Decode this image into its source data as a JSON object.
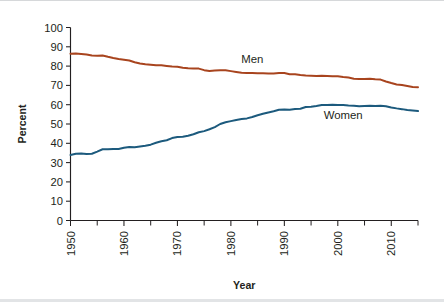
{
  "chart_data": {
    "type": "line",
    "title": "",
    "subtitle": "",
    "xlabel": "Year",
    "ylabel": "Percent",
    "xlim": [
      1950,
      2015
    ],
    "ylim": [
      0,
      100
    ],
    "grid": false,
    "legend_position": "inline-annotation",
    "x_ticks_major": [
      1950,
      1960,
      1970,
      1980,
      1990,
      2000,
      2010
    ],
    "x_ticks_minor": [
      1955,
      1965,
      1975,
      1985,
      1995,
      2005,
      2015
    ],
    "x_tick_labels": [
      "1950",
      "1960",
      "1970",
      "1980",
      "1990",
      "2000",
      "2010"
    ],
    "y_ticks": [
      0,
      10,
      20,
      30,
      40,
      50,
      60,
      70,
      80,
      90,
      100
    ],
    "y_tick_labels": [
      "0",
      "10",
      "20",
      "30",
      "40",
      "50",
      "60",
      "70",
      "80",
      "90",
      "100"
    ],
    "annotations": [
      {
        "text": "Men",
        "x": 1984,
        "y": 81.5
      },
      {
        "text": "Women",
        "x": 2001,
        "y": 52.5
      }
    ],
    "x": [
      1950,
      1951,
      1952,
      1953,
      1954,
      1955,
      1956,
      1957,
      1958,
      1959,
      1960,
      1961,
      1962,
      1963,
      1964,
      1965,
      1966,
      1967,
      1968,
      1969,
      1970,
      1971,
      1972,
      1973,
      1974,
      1975,
      1976,
      1977,
      1978,
      1979,
      1980,
      1981,
      1982,
      1983,
      1984,
      1985,
      1986,
      1987,
      1988,
      1989,
      1990,
      1991,
      1992,
      1993,
      1994,
      1995,
      1996,
      1997,
      1998,
      1999,
      2000,
      2001,
      2002,
      2003,
      2004,
      2005,
      2006,
      2007,
      2008,
      2009,
      2010,
      2011,
      2012,
      2013,
      2014,
      2015
    ],
    "series": [
      {
        "name": "Men",
        "color": "#A8441E",
        "values": [
          86.4,
          86.5,
          86.3,
          86.0,
          85.5,
          85.4,
          85.5,
          84.8,
          84.2,
          83.7,
          83.3,
          82.9,
          82.0,
          81.4,
          81.0,
          80.7,
          80.4,
          80.4,
          80.1,
          79.8,
          79.7,
          79.1,
          78.9,
          78.8,
          78.7,
          77.9,
          77.5,
          77.7,
          77.9,
          77.8,
          77.4,
          77.0,
          76.6,
          76.4,
          76.4,
          76.3,
          76.3,
          76.2,
          76.2,
          76.4,
          76.4,
          75.8,
          75.8,
          75.4,
          75.1,
          75.0,
          74.9,
          75.0,
          74.9,
          74.7,
          74.8,
          74.4,
          74.1,
          73.5,
          73.3,
          73.3,
          73.5,
          73.2,
          73.0,
          72.0,
          71.2,
          70.5,
          70.2,
          69.7,
          69.2,
          69.1
        ]
      },
      {
        "name": "Women",
        "color": "#1C5A7D",
        "values": [
          33.9,
          34.6,
          34.7,
          34.4,
          34.6,
          35.7,
          36.9,
          36.9,
          37.1,
          37.1,
          37.7,
          38.1,
          37.9,
          38.3,
          38.7,
          39.3,
          40.3,
          41.1,
          41.6,
          42.7,
          43.3,
          43.4,
          43.9,
          44.7,
          45.7,
          46.3,
          47.3,
          48.4,
          50.0,
          50.9,
          51.5,
          52.1,
          52.6,
          52.9,
          53.6,
          54.5,
          55.3,
          56.0,
          56.6,
          57.4,
          57.5,
          57.4,
          57.8,
          57.9,
          58.8,
          58.9,
          59.3,
          59.8,
          59.8,
          60.0,
          59.9,
          59.8,
          59.6,
          59.5,
          59.2,
          59.3,
          59.4,
          59.3,
          59.5,
          59.2,
          58.6,
          58.1,
          57.7,
          57.2,
          57.0,
          56.7
        ]
      }
    ]
  },
  "figure": {
    "background_color": "#FFFFFF",
    "border_color": "#D6D8DA"
  }
}
